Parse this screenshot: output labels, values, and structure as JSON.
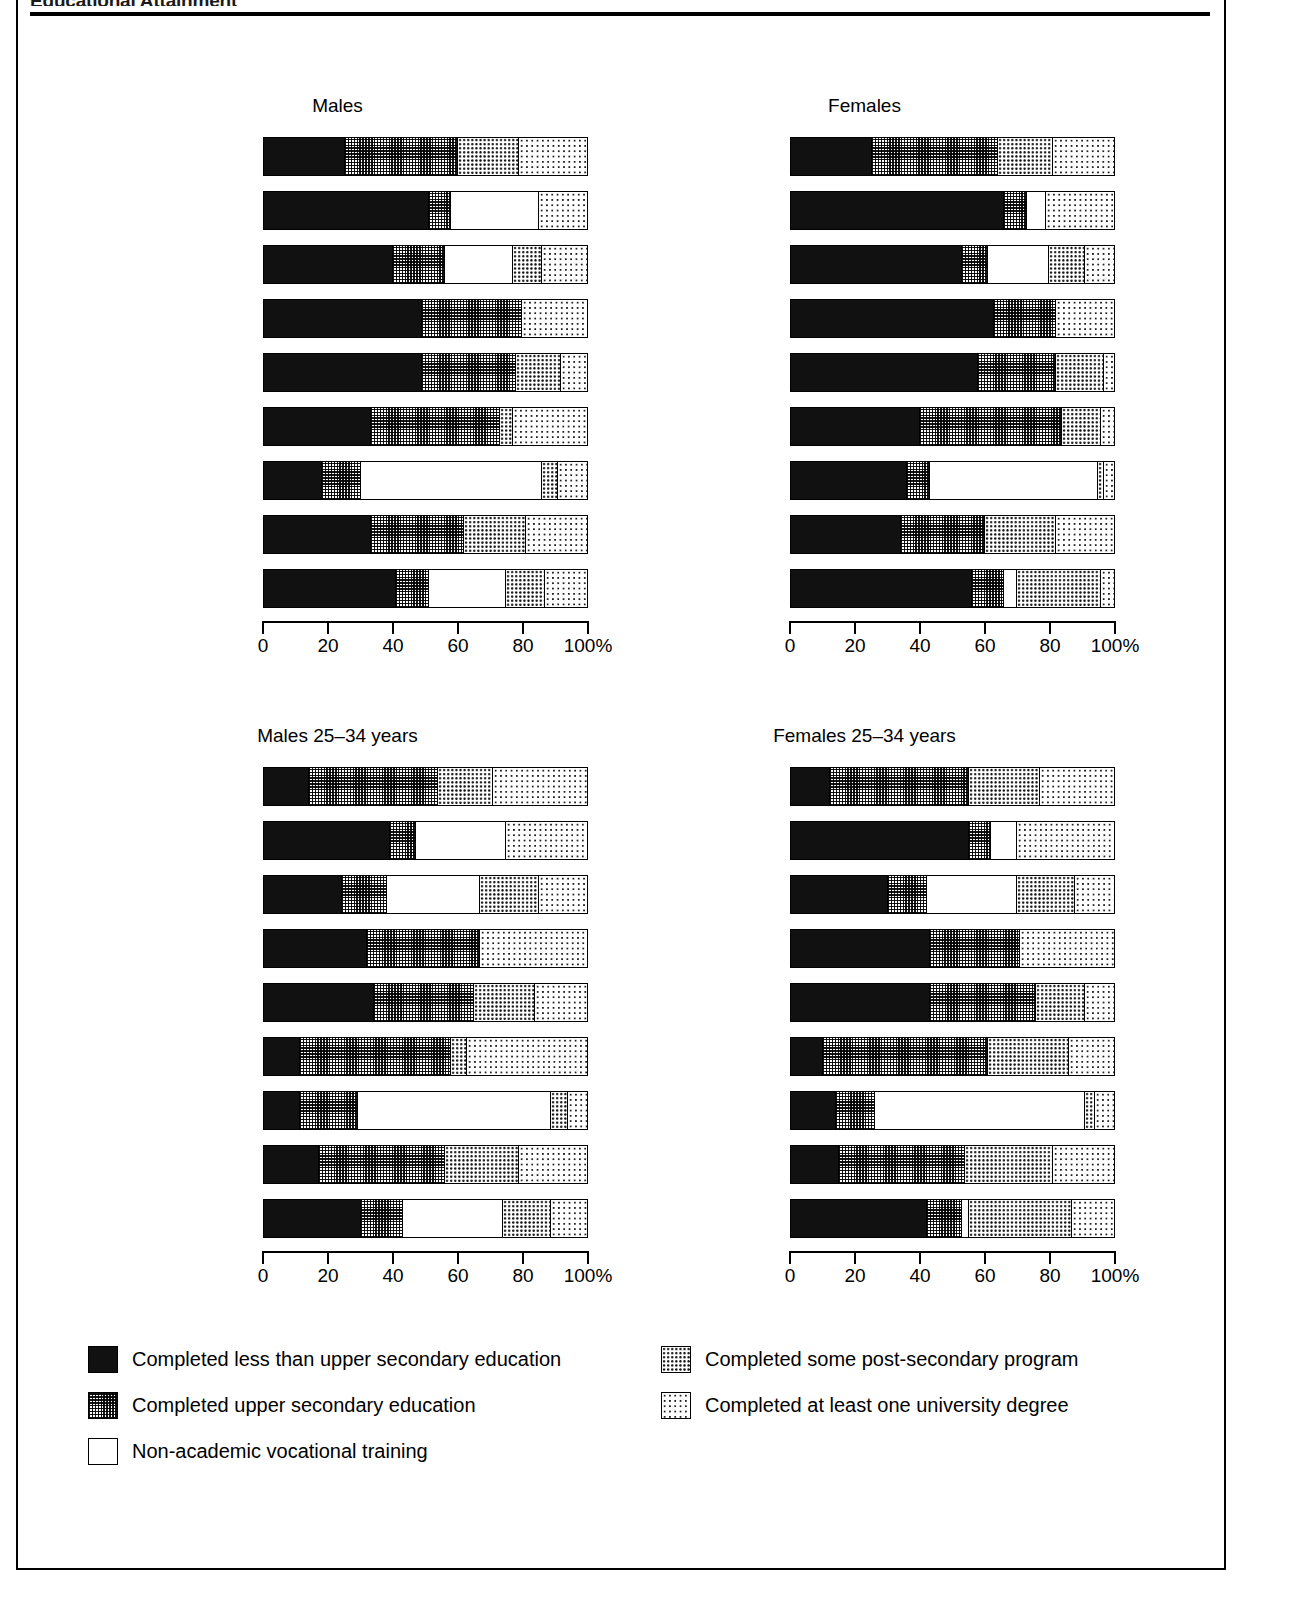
{
  "header": {
    "title": "Educational Attainment"
  },
  "legend": {
    "items": [
      {
        "key": "black",
        "label": "Completed less than upper secondary education",
        "pattern": "solid-black"
      },
      {
        "key": "checker",
        "label": "Completed upper secondary education",
        "pattern": "dense-checker"
      },
      {
        "key": "white",
        "label": "Non-academic vocational training",
        "pattern": "white"
      },
      {
        "key": "dots",
        "label": "Completed some post-secondary program",
        "pattern": "medium-dots"
      },
      {
        "key": "light",
        "label": "Completed at least one university degree",
        "pattern": "light-dots"
      }
    ]
  },
  "axis": {
    "ticks": [
      0,
      20,
      40,
      60,
      80,
      100
    ],
    "tick_labels": [
      "0",
      "20",
      "40",
      "60",
      "80",
      "100%"
    ],
    "min": 0,
    "max": 100,
    "unit": "%"
  },
  "chart_data": {
    "type": "bar",
    "orientation": "horizontal",
    "stacked": true,
    "stacked_normalized": true,
    "title": "Educational Attainment",
    "xlabel": "",
    "ylabel": "",
    "xlim": [
      0,
      100
    ],
    "grid": false,
    "legend_position": "bottom",
    "series": [
      {
        "name": "Completed less than upper secondary education",
        "pattern": "solid-black"
      },
      {
        "name": "Completed upper secondary education",
        "pattern": "dense-checker"
      },
      {
        "name": "Non-academic vocational training",
        "pattern": "white"
      },
      {
        "name": "Completed some post-secondary program",
        "pattern": "medium-dots"
      },
      {
        "name": "Completed at least one university degree",
        "pattern": "light-dots"
      }
    ],
    "categories": [
      "United States",
      "United Kingdom",
      "Sweden",
      "Norway",
      "Netherlands",
      "Japan",
      "Germany",
      "Canada",
      "Australia"
    ],
    "panels": [
      {
        "id": "males",
        "title": "Males",
        "rows": [
          {
            "category": "United States",
            "values": [
              25,
              35,
              0,
              19,
              21
            ]
          },
          {
            "category": "United Kingdom",
            "values": [
              51,
              7,
              27,
              0,
              15
            ]
          },
          {
            "category": "Sweden",
            "values": [
              40,
              16,
              21,
              9,
              14
            ]
          },
          {
            "category": "Norway",
            "values": [
              49,
              31,
              0,
              0,
              20
            ]
          },
          {
            "category": "Netherlands",
            "values": [
              49,
              29,
              0,
              14,
              8
            ]
          },
          {
            "category": "Japan",
            "values": [
              33,
              40,
              0,
              4,
              23
            ]
          },
          {
            "category": "Germany",
            "values": [
              18,
              12,
              56,
              5,
              9
            ]
          },
          {
            "category": "Canada",
            "values": [
              33,
              29,
              0,
              19,
              19
            ]
          },
          {
            "category": "Australia",
            "values": [
              41,
              10,
              24,
              12,
              13
            ]
          }
        ]
      },
      {
        "id": "females",
        "title": "Females",
        "rows": [
          {
            "category": "United States",
            "values": [
              25,
              39,
              0,
              17,
              19
            ]
          },
          {
            "category": "United Kingdom",
            "values": [
              66,
              7,
              6,
              0,
              21
            ]
          },
          {
            "category": "Sweden",
            "values": [
              53,
              8,
              19,
              11,
              9
            ]
          },
          {
            "category": "Norway",
            "values": [
              63,
              19,
              0,
              0,
              18
            ]
          },
          {
            "category": "Netherlands",
            "values": [
              58,
              24,
              0,
              15,
              3
            ]
          },
          {
            "category": "Japan",
            "values": [
              40,
              44,
              0,
              12,
              4
            ]
          },
          {
            "category": "Germany",
            "values": [
              36,
              7,
              52,
              2,
              3
            ]
          },
          {
            "category": "Canada",
            "values": [
              34,
              26,
              0,
              22,
              18
            ]
          },
          {
            "category": "Australia",
            "values": [
              56,
              10,
              4,
              26,
              4
            ]
          }
        ]
      },
      {
        "id": "males-25-34",
        "title": "Males 25–34 years",
        "rows": [
          {
            "category": "United States",
            "values": [
              14,
              40,
              0,
              17,
              29
            ]
          },
          {
            "category": "United Kingdom",
            "values": [
              39,
              8,
              28,
              0,
              25
            ]
          },
          {
            "category": "Sweden",
            "values": [
              24,
              14,
              29,
              18,
              15
            ]
          },
          {
            "category": "Norway",
            "values": [
              32,
              35,
              0,
              0,
              33
            ]
          },
          {
            "category": "Netherlands",
            "values": [
              34,
              31,
              0,
              19,
              16
            ]
          },
          {
            "category": "Japan",
            "values": [
              11,
              47,
              0,
              5,
              37
            ]
          },
          {
            "category": "Germany",
            "values": [
              11,
              18,
              60,
              5,
              6
            ]
          },
          {
            "category": "Canada",
            "values": [
              17,
              39,
              0,
              23,
              21
            ]
          },
          {
            "category": "Australia",
            "values": [
              30,
              13,
              31,
              15,
              11
            ]
          }
        ]
      },
      {
        "id": "females-25-34",
        "title": "Females 25–34 years",
        "rows": [
          {
            "category": "United States",
            "values": [
              12,
              43,
              0,
              22,
              23
            ]
          },
          {
            "category": "United Kingdom",
            "values": [
              55,
              7,
              8,
              0,
              30
            ]
          },
          {
            "category": "Sweden",
            "values": [
              30,
              12,
              28,
              18,
              12
            ]
          },
          {
            "category": "Norway",
            "values": [
              43,
              28,
              0,
              0,
              29
            ]
          },
          {
            "category": "Netherlands",
            "values": [
              43,
              33,
              0,
              15,
              9
            ]
          },
          {
            "category": "Japan",
            "values": [
              10,
              51,
              0,
              25,
              14
            ]
          },
          {
            "category": "Germany",
            "values": [
              14,
              12,
              65,
              3,
              6
            ]
          },
          {
            "category": "Canada",
            "values": [
              15,
              39,
              0,
              27,
              19
            ]
          },
          {
            "category": "Australia",
            "values": [
              42,
              11,
              2,
              32,
              13
            ]
          }
        ]
      }
    ]
  }
}
